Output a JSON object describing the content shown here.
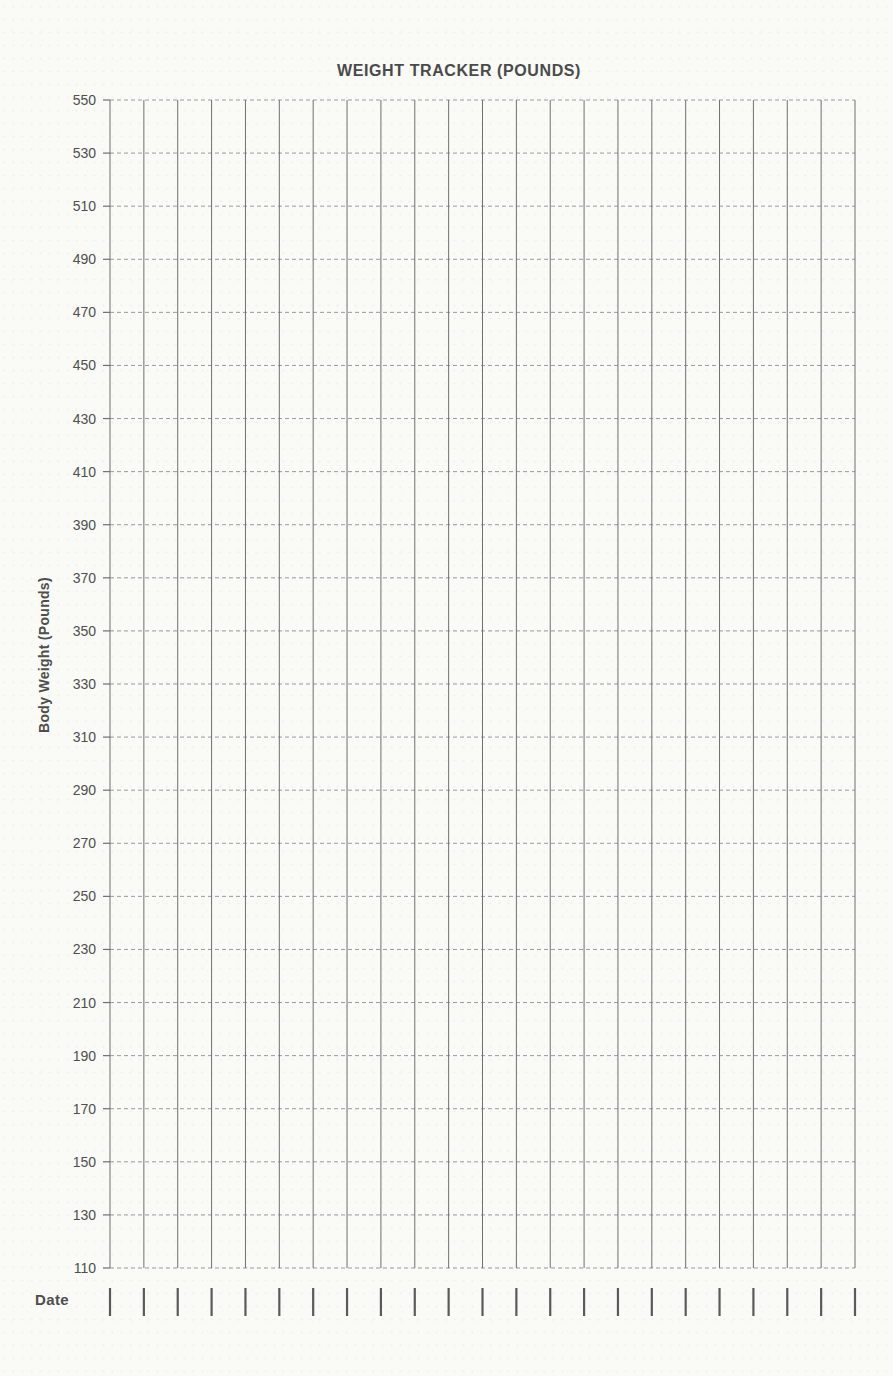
{
  "page": {
    "background_color": "#fafaf7",
    "text_color": "#4e4e4e"
  },
  "chart_data": {
    "type": "line",
    "title": "WEIGHT TRACKER (POUNDS)",
    "ylabel": "Body Weight (Pounds)",
    "xlabel": "Date",
    "ylim": [
      110,
      550
    ],
    "y_tick_step": 20,
    "y_ticks": [
      550,
      530,
      510,
      490,
      470,
      450,
      430,
      410,
      390,
      370,
      350,
      330,
      310,
      290,
      270,
      250,
      230,
      210,
      190,
      170,
      150,
      130,
      110
    ],
    "x_columns": 22,
    "x_date_tick_count": 23,
    "series": [],
    "grid": "on",
    "legend": "none",
    "colors": {
      "title": "#4a4a4a",
      "axis_titles": "#4e4e4e",
      "tick_labels": "#4f4f4f",
      "grid_vertical": "#6f6f6f",
      "grid_horizontal": "#9a9a9a",
      "axis_tick": "#6f6f6f",
      "date_tick": "#5a5a5a"
    }
  }
}
